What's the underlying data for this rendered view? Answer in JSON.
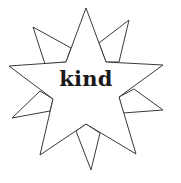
{
  "figure": {
    "word": "kind",
    "stroke_color": "#3a3a3a",
    "fill_color": "#ffffff",
    "text_color": "#1a1a1a"
  }
}
